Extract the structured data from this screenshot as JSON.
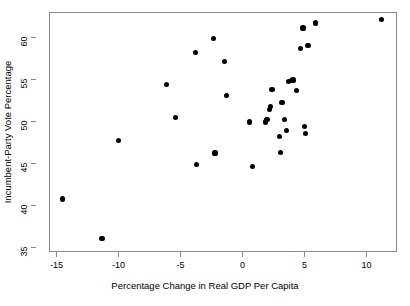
{
  "chart_data": {
    "type": "scatter",
    "title": "",
    "xlabel": "Percentage Change in Real GDP Per Capita",
    "ylabel": "Incumbent-Party Vote Percentage",
    "xlim": [
      -15.6,
      12.3
    ],
    "ylim": [
      34.6,
      63.0
    ],
    "xticks": [
      -15,
      -10,
      -5,
      0,
      5,
      10
    ],
    "xtick_labels": [
      "-15",
      "-10",
      "-5",
      "0",
      "5",
      "10"
    ],
    "yticks": [
      35,
      40,
      45,
      50,
      55,
      60
    ],
    "ytick_labels": [
      "35",
      "40",
      "45",
      "50",
      "55",
      "60"
    ],
    "grid": false,
    "legend": false,
    "marker": {
      "shape": "circle",
      "color": "#000000",
      "size": 5.2
    },
    "frame_color": "#8a8a8a",
    "background": "#ffffff",
    "points": [
      {
        "x": -14.6,
        "y": 40.8
      },
      {
        "x": -11.4,
        "y": 36.1
      },
      {
        "x": -10.1,
        "y": 47.8
      },
      {
        "x": -6.2,
        "y": 54.5
      },
      {
        "x": -5.5,
        "y": 50.5
      },
      {
        "x": -3.9,
        "y": 58.3
      },
      {
        "x": -3.8,
        "y": 44.9
      },
      {
        "x": -2.4,
        "y": 60.0
      },
      {
        "x": -2.3,
        "y": 46.3
      },
      {
        "x": -1.5,
        "y": 57.2
      },
      {
        "x": -1.4,
        "y": 53.2
      },
      {
        "x": 0.5,
        "y": 50.0
      },
      {
        "x": 0.7,
        "y": 44.7
      },
      {
        "x": 1.8,
        "y": 50.0
      },
      {
        "x": 1.9,
        "y": 50.3
      },
      {
        "x": 2.1,
        "y": 51.5
      },
      {
        "x": 2.2,
        "y": 51.8
      },
      {
        "x": 2.3,
        "y": 53.9
      },
      {
        "x": 2.9,
        "y": 48.3
      },
      {
        "x": 3.0,
        "y": 46.4
      },
      {
        "x": 3.1,
        "y": 52.3
      },
      {
        "x": 3.3,
        "y": 50.3
      },
      {
        "x": 3.5,
        "y": 49.0
      },
      {
        "x": 3.6,
        "y": 54.8
      },
      {
        "x": 3.9,
        "y": 54.9
      },
      {
        "x": 4.0,
        "y": 55.0
      },
      {
        "x": 4.3,
        "y": 53.8
      },
      {
        "x": 4.6,
        "y": 58.8
      },
      {
        "x": 4.8,
        "y": 61.2
      },
      {
        "x": 4.9,
        "y": 49.5
      },
      {
        "x": 5.0,
        "y": 48.6
      },
      {
        "x": 5.2,
        "y": 59.1
      },
      {
        "x": 5.8,
        "y": 61.8
      },
      {
        "x": 11.1,
        "y": 62.2
      }
    ]
  }
}
